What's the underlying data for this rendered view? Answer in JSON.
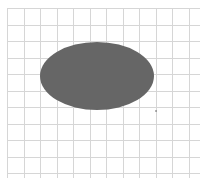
{
  "canvas": {
    "width": 204,
    "height": 181,
    "background": "#ffffff"
  },
  "grid": {
    "color": "#d6d6d6",
    "x_start": 7,
    "y_start": 8,
    "spacing": 16.5,
    "x_end": 200,
    "y_end": 178
  },
  "shape": {
    "type": "ellipse",
    "cx": 97,
    "cy": 76,
    "rx": 57,
    "ry": 34,
    "fill": "#666666"
  },
  "dot": {
    "x": 156,
    "y": 111,
    "color": "#555555"
  }
}
